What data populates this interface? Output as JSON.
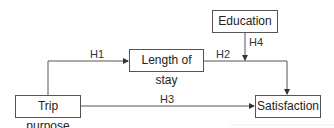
{
  "diagram": {
    "nodes": {
      "education": "Education",
      "length_of_stay": "Length of stay",
      "trip_purpose": "Trip purpose",
      "satisfaction": "Satisfaction"
    },
    "edges": [
      {
        "label": "H1",
        "from": "Trip purpose",
        "to": "Length of stay"
      },
      {
        "label": "H2",
        "from": "Length of stay",
        "to": "Satisfaction"
      },
      {
        "label": "H3",
        "from": "Trip purpose",
        "to": "Satisfaction"
      },
      {
        "label": "H4",
        "from": "Education",
        "to": "H2 path (moderation)"
      }
    ],
    "labels": {
      "h1": "H1",
      "h2": "H2",
      "h3": "H3",
      "h4": "H4"
    },
    "colors": {
      "line": "#555555",
      "text": "#222222"
    }
  }
}
